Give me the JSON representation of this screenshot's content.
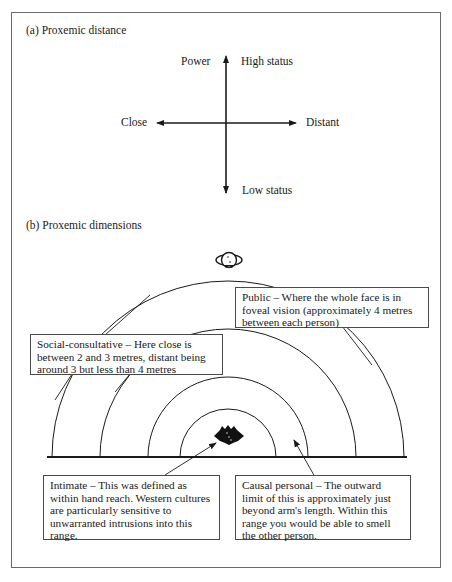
{
  "part_a": {
    "title": "(a) Proxemic distance",
    "labels": {
      "power": "Power",
      "high_status": "High status",
      "close": "Close",
      "distant": "Distant",
      "low_status": "Low status"
    }
  },
  "part_b": {
    "title": "(b) Proxemic dimensions",
    "icons": {
      "viewer": "person-head-icon",
      "subject": "person-top-view-icon"
    },
    "zones": [
      {
        "name": "Public",
        "text": "Public – Where the whole face is in foveal vision (approximately 4 metres between each person)"
      },
      {
        "name": "Social-consultative",
        "text": "Social-consultative – Here close is between 2 and 3 metres, distant being around 3 but less than 4 metres"
      },
      {
        "name": "Intimate",
        "text": "Intimate – This was defined as within hand reach. Western cultures are particularly sensitive to unwarranted intrusions into this range."
      },
      {
        "name": "Causal personal",
        "text": "Causal personal – The outward limit of this is approximately just beyond arm's length. Within this range you would be able to smell the other person."
      }
    ]
  },
  "colors": {
    "line": "#1a1a1a",
    "frame": "#6a6a6a",
    "background": "#ffffff"
  }
}
